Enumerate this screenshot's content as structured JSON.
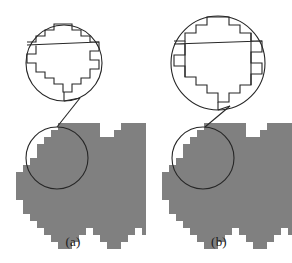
{
  "figure": {
    "type": "line-drawing-diagram",
    "title": "",
    "background_color": "#ffffff",
    "line_color": "#262626",
    "fill_color": "#808080",
    "width": 292,
    "height": 263
  },
  "panels": [
    {
      "id": "a",
      "caption": "(a)",
      "blob": {
        "name": "pixelated-region",
        "fill": "#808080",
        "cell_size": 7,
        "origin_x": 16,
        "origin_y": 123,
        "rows": [
          "00000011111100011111000000",
          "00000111111100111111100000",
          "00001111111111111111110000",
          "00011111111111111111111000",
          "00011111111111111111111100",
          "00111111111111111111111100",
          "01111111111111111111111110",
          "11111111111111111111111110",
          "11111111111111111111111111",
          "11111111111111111111111111",
          "11111111111111111111111111",
          "01111111111111111111111110",
          "01111111111111111111111110",
          "00111111111111111111111100",
          "00011111111111111111111000",
          "00001111110111111011111000",
          "00000111100011110001110000",
          "00000011000001100000110000"
        ]
      },
      "magnifier_circle": {
        "name": "magnifier-lens",
        "cx": 57,
        "cy": 158,
        "r": 31
      },
      "zoom_circle": {
        "name": "zoom-view-circle",
        "cx": 64,
        "cy": 63,
        "r": 38
      },
      "connector": {
        "name": "magnifier-connector",
        "x1": 64,
        "y1": 101,
        "x2": 80,
        "y2": 98,
        "x3": 57,
        "y3": 127
      },
      "detail_style": "staircase-boundary",
      "detail_label": "jagged pixel staircase boundary"
    },
    {
      "id": "b",
      "caption": "(b)",
      "blob": {
        "name": "pixelated-region",
        "fill": "#808080",
        "cell_size": 7,
        "origin_x": 162,
        "origin_y": 123,
        "rows": [
          "00000011111100011111000000",
          "00000111111100111111100000",
          "00001111111111111111110000",
          "00011111111111111111111000",
          "00011111111111111111111100",
          "00111111111111111111111100",
          "01111111111111111111111110",
          "11111111111111111111111110",
          "11111111111111111111111111",
          "11111111111111111111111111",
          "11111111111111111111111111",
          "01111111111111111111111110",
          "01111111111111111111111110",
          "00111111111111111111111100",
          "00011111111111111111111000",
          "00001111110111111011111000",
          "00000111100011110001110000",
          "00000011000001100000110000"
        ]
      },
      "magnifier_circle": {
        "name": "magnifier-lens",
        "cx": 203,
        "cy": 158,
        "r": 31
      },
      "zoom_circle": {
        "name": "zoom-view-circle",
        "cx": 218,
        "cy": 63,
        "r": 47
      },
      "connector": {
        "name": "magnifier-connector",
        "x1": 218,
        "y1": 110,
        "x2": 228,
        "y2": 106,
        "x3": 205,
        "y3": 127
      },
      "detail_style": "line-segment-approximation",
      "detail_label": "staircase with straight line-segment chords"
    }
  ]
}
